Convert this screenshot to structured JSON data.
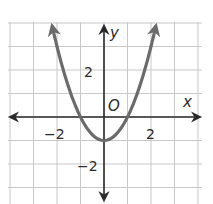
{
  "chart_data": {
    "type": "line",
    "title": "",
    "function": "y = x^2 - 1",
    "xlabel": "x",
    "ylabel": "y",
    "origin_label": "O",
    "xlim": [
      -4,
      4
    ],
    "ylim": [
      -3,
      4
    ],
    "grid": true,
    "grid_step": 1,
    "x_tick_labels": [
      {
        "value": -2,
        "label": "−2"
      },
      {
        "value": 2,
        "label": "2"
      }
    ],
    "y_tick_labels": [
      {
        "value": 2,
        "label": "2"
      },
      {
        "value": -2,
        "label": "−2"
      }
    ],
    "series": [
      {
        "name": "parabola",
        "x": [
          -2.2,
          -2,
          -1.5,
          -1,
          -0.5,
          0,
          0.5,
          1,
          1.5,
          2,
          2.2
        ],
        "y": [
          3.84,
          3,
          1.25,
          0,
          -0.75,
          -1,
          -0.75,
          0,
          1.25,
          3,
          3.84
        ],
        "arrows_at_ends": true
      }
    ],
    "vertex": [
      0,
      -1
    ],
    "x_intercepts": [
      -1,
      1
    ],
    "y_intercept": -1,
    "legend": null
  },
  "colors": {
    "curve": "#6b6b6b",
    "axes": "#2a2a2a",
    "grid": "#c8c8c8",
    "background": "#ffffff"
  },
  "labels": {
    "x_axis": "x",
    "y_axis": "y",
    "origin": "O",
    "x_neg2": "−2",
    "x_pos2": "2",
    "y_pos2": "2",
    "y_neg2": "−2"
  }
}
